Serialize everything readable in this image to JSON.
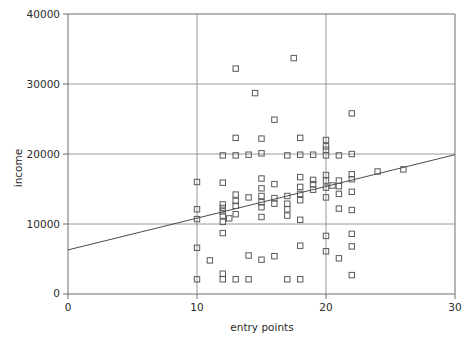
{
  "chart_data": {
    "type": "scatter",
    "title": "",
    "xlabel": "entry points",
    "ylabel": "income",
    "xlim": [
      0,
      30
    ],
    "ylim": [
      0,
      40000
    ],
    "xticks": [
      0,
      10,
      20,
      30
    ],
    "xticklabels": [
      "0",
      "10",
      "20",
      "30"
    ],
    "yticks": [
      0,
      10000,
      20000,
      30000,
      40000
    ],
    "yticklabels": [
      "0",
      "10000",
      "20000",
      "30000",
      "40000"
    ],
    "grid": "vertical gridlines at x=10 and x=20; horizontal gridlines at y=10000, 20000, 30000",
    "legend": "none",
    "marker": "open square",
    "marker_color": "#595959",
    "line_color": "#4a4a4a",
    "trendline": {
      "name": "linear fit",
      "x": [
        0,
        30
      ],
      "y": [
        6300,
        19900
      ],
      "slope": 453,
      "intercept": 6300
    },
    "series": [
      {
        "name": "income vs entry points",
        "points": [
          [
            10.0,
            2100
          ],
          [
            10.0,
            6600
          ],
          [
            10.0,
            10700
          ],
          [
            10.0,
            12100
          ],
          [
            10.0,
            16000
          ],
          [
            11.0,
            4800
          ],
          [
            12.0,
            2100
          ],
          [
            12.0,
            2900
          ],
          [
            12.0,
            8700
          ],
          [
            12.0,
            10300
          ],
          [
            12.0,
            11200
          ],
          [
            12.0,
            11800
          ],
          [
            12.0,
            12300
          ],
          [
            12.0,
            12800
          ],
          [
            12.0,
            15900
          ],
          [
            12.0,
            19800
          ],
          [
            12.5,
            10800
          ],
          [
            13.0,
            2100
          ],
          [
            13.0,
            11400
          ],
          [
            13.0,
            12600
          ],
          [
            13.0,
            13300
          ],
          [
            13.0,
            14200
          ],
          [
            13.0,
            19800
          ],
          [
            13.0,
            22300
          ],
          [
            13.0,
            32200
          ],
          [
            14.0,
            2100
          ],
          [
            14.0,
            5500
          ],
          [
            14.0,
            13800
          ],
          [
            14.0,
            19900
          ],
          [
            14.5,
            28700
          ],
          [
            15.0,
            4900
          ],
          [
            15.0,
            11000
          ],
          [
            15.0,
            12400
          ],
          [
            15.0,
            13100
          ],
          [
            15.0,
            14000
          ],
          [
            15.0,
            15100
          ],
          [
            15.0,
            16500
          ],
          [
            15.0,
            20100
          ],
          [
            15.0,
            22200
          ],
          [
            16.0,
            5400
          ],
          [
            16.0,
            12900
          ],
          [
            16.0,
            13700
          ],
          [
            16.0,
            15700
          ],
          [
            16.0,
            24900
          ],
          [
            17.0,
            2100
          ],
          [
            17.0,
            11200
          ],
          [
            17.0,
            12100
          ],
          [
            17.0,
            12900
          ],
          [
            17.0,
            14000
          ],
          [
            17.0,
            19800
          ],
          [
            17.5,
            33700
          ],
          [
            18.0,
            2100
          ],
          [
            18.0,
            6900
          ],
          [
            18.0,
            10600
          ],
          [
            18.0,
            13400
          ],
          [
            18.0,
            14300
          ],
          [
            18.0,
            15300
          ],
          [
            18.0,
            16700
          ],
          [
            18.0,
            19900
          ],
          [
            18.0,
            22300
          ],
          [
            19.0,
            14900
          ],
          [
            19.0,
            15700
          ],
          [
            19.0,
            16300
          ],
          [
            19.0,
            19900
          ],
          [
            20.0,
            6100
          ],
          [
            20.0,
            8300
          ],
          [
            20.0,
            13800
          ],
          [
            20.0,
            15200
          ],
          [
            20.0,
            16200
          ],
          [
            20.0,
            17000
          ],
          [
            20.0,
            19800
          ],
          [
            20.0,
            20600
          ],
          [
            20.0,
            21100
          ],
          [
            20.0,
            22000
          ],
          [
            20.5,
            15500
          ],
          [
            21.0,
            5100
          ],
          [
            21.0,
            12200
          ],
          [
            21.0,
            14300
          ],
          [
            21.0,
            15400
          ],
          [
            21.0,
            16200
          ],
          [
            21.0,
            19800
          ],
          [
            22.0,
            2700
          ],
          [
            22.0,
            6800
          ],
          [
            22.0,
            8600
          ],
          [
            22.0,
            12000
          ],
          [
            22.0,
            14600
          ],
          [
            22.0,
            16400
          ],
          [
            22.0,
            17100
          ],
          [
            22.0,
            20000
          ],
          [
            22.0,
            25800
          ],
          [
            24.0,
            17500
          ],
          [
            26.0,
            17800
          ]
        ]
      }
    ]
  },
  "axes": {
    "frame": "left and bottom spines plus plot box",
    "background": "#ffffff"
  }
}
